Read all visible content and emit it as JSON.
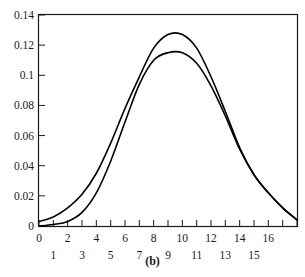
{
  "figure": {
    "caption": "(b)",
    "caption_position": "bottom-center"
  },
  "chart_data": {
    "type": "line",
    "title": "",
    "subtitle": "",
    "xlabel": "",
    "ylabel": "",
    "xlim": [
      0,
      18
    ],
    "ylim": [
      0,
      0.14
    ],
    "grid": false,
    "legend": null,
    "legend_position": "none",
    "background_color": "#ffffff",
    "line_color": "#000000",
    "axis_color": "#1a1a1a",
    "x_tick_values": [
      0,
      1,
      2,
      3,
      4,
      5,
      6,
      7,
      8,
      9,
      10,
      11,
      12,
      13,
      14,
      15,
      16,
      17,
      18
    ],
    "x_tick_labels_upper_row": [
      "0",
      "2",
      "4",
      "6",
      "8",
      "10",
      "12",
      "14",
      "16"
    ],
    "x_tick_labels_lower_row": [
      "1",
      "3",
      "5",
      "7",
      "9",
      "11",
      "13",
      "15"
    ],
    "x_tick_upper_values": [
      0,
      2,
      4,
      6,
      8,
      10,
      12,
      14,
      16
    ],
    "x_tick_lower_values": [
      1,
      3,
      5,
      7,
      9,
      11,
      13,
      15
    ],
    "y_tick_values": [
      0,
      0.02,
      0.04,
      0.06,
      0.08,
      0.1,
      0.12,
      0.14
    ],
    "y_tick_labels": [
      "0",
      "0.02",
      "0.04",
      "0.06",
      "0.08",
      "0.1",
      "0.12",
      "0.14"
    ],
    "x": [
      0,
      1,
      2,
      3,
      4,
      5,
      6,
      7,
      8,
      9,
      10,
      11,
      12,
      13,
      14,
      15,
      16,
      17,
      18
    ],
    "series": [
      {
        "name": "curve-upper",
        "values": [
          0.003,
          0.006,
          0.012,
          0.021,
          0.035,
          0.055,
          0.078,
          0.099,
          0.118,
          0.127,
          0.127,
          0.118,
          0.099,
          0.076,
          0.052,
          0.034,
          0.022,
          0.012,
          0.004
        ]
      },
      {
        "name": "curve-lower",
        "values": [
          0.0,
          0.001,
          0.003,
          0.009,
          0.022,
          0.043,
          0.069,
          0.094,
          0.11,
          0.115,
          0.115,
          0.108,
          0.093,
          0.073,
          0.051,
          0.034,
          0.022,
          0.012,
          0.004
        ]
      }
    ]
  }
}
